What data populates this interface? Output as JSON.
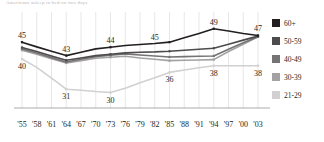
{
  "title": "Americans asleep in bed on two days",
  "legend": {
    "position": "right",
    "items": [
      {
        "label": "60+",
        "color": "#231f20"
      },
      {
        "label": "50-59",
        "color": "#4d4b4c"
      },
      {
        "label": "40-49",
        "color": "#757374"
      },
      {
        "label": "30-39",
        "color": "#a3a1a2"
      },
      {
        "label": "21-29",
        "color": "#d2d0d1"
      }
    ]
  },
  "chart_data": {
    "type": "line",
    "title": "Americans asleep in bed on two days",
    "xlabel": "",
    "ylabel": "",
    "grid": "vertical",
    "ylim": [
      26,
      51
    ],
    "x": [
      "'55",
      "'58",
      "'61",
      "'64",
      "'67",
      "'70",
      "'73",
      "'76",
      "'79",
      "'82",
      "'85",
      "'88",
      "'91",
      "'94",
      "'97",
      "'00",
      "'03"
    ],
    "series": [
      {
        "name": "60+",
        "color": "#231f20",
        "values": [
          45,
          43.6,
          42.3,
          41.0,
          42.0,
          43.0,
          43.5,
          44.0,
          44.3,
          44.6,
          45.0,
          46.3,
          47.6,
          49.0,
          48.3,
          47.6,
          47.0
        ]
      },
      {
        "name": "50-59",
        "color": "#4d4b4c",
        "values": [
          43.4,
          42.2,
          40.9,
          39.6,
          40.3,
          41.0,
          41.4,
          41.8,
          42.0,
          42.1,
          42.3,
          42.6,
          42.9,
          43.2,
          44.4,
          45.6,
          46.8
        ]
      },
      {
        "name": "40-49",
        "color": "#757374",
        "values": [
          43.0,
          41.8,
          40.4,
          39.1,
          39.9,
          40.7,
          41.1,
          41.5,
          41.2,
          40.9,
          40.6,
          40.7,
          40.8,
          40.9,
          42.9,
          44.8,
          46.6
        ]
      },
      {
        "name": "30-39",
        "color": "#a3a1a2",
        "values": [
          42.6,
          41.4,
          40.1,
          38.8,
          39.5,
          40.2,
          40.5,
          40.8,
          40.3,
          39.9,
          39.5,
          39.6,
          39.7,
          39.8,
          42.2,
          44.4,
          46.6
        ]
      },
      {
        "name": "21-29",
        "color": "#d2d0d1",
        "values": [
          40,
          37.5,
          34.3,
          31.0,
          30.7,
          30.3,
          30.0,
          31.3,
          32.9,
          34.4,
          36.0,
          36.7,
          37.4,
          38.0,
          38.0,
          38.0,
          38.0
        ]
      }
    ],
    "point_labels": [
      {
        "series": "60+",
        "x": "'55",
        "value": "45",
        "anchor": "above"
      },
      {
        "series": "60+",
        "x": "'64",
        "value": "43",
        "anchor": "above"
      },
      {
        "series": "60+",
        "x": "'73",
        "value": "44",
        "anchor": "above"
      },
      {
        "series": "60+",
        "x": "'82",
        "value": "45",
        "anchor": "above"
      },
      {
        "series": "60+",
        "x": "'94",
        "value": "49",
        "anchor": "above"
      },
      {
        "series": "60+",
        "x": "'03",
        "value": "47",
        "anchor": "above"
      },
      {
        "series": "21-29",
        "x": "'55",
        "value": "40",
        "anchor": "below"
      },
      {
        "series": "21-29",
        "x": "'64",
        "value": "31",
        "anchor": "below"
      },
      {
        "series": "21-29",
        "x": "'73",
        "value": "30",
        "anchor": "below"
      },
      {
        "series": "21-29",
        "x": "'85",
        "value": "36",
        "anchor": "below"
      },
      {
        "series": "21-29",
        "x": "'94",
        "value": "38",
        "anchor": "below"
      },
      {
        "series": "21-29",
        "x": "'03",
        "value": "38",
        "anchor": "below"
      }
    ]
  }
}
